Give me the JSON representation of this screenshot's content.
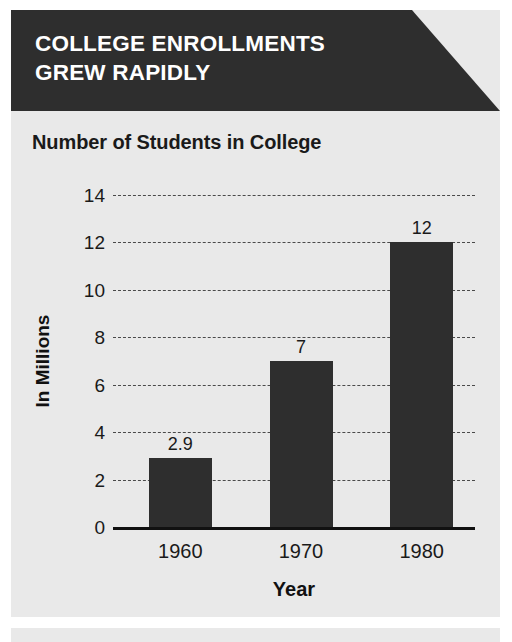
{
  "header": {
    "title": "COLLEGE ENROLLMENTS\nGREW RAPIDLY"
  },
  "colors": {
    "banner_bg": "#2e2e2e",
    "panel_bg": "#e9e9e9",
    "bar": "#2e2e2e",
    "text": "#1a1a1a",
    "header_text": "#ffffff",
    "gridline": "#4a4a4a",
    "axis": "#111111"
  },
  "chart_data": {
    "type": "bar",
    "title": "Number of Students in College",
    "xlabel": "Year",
    "ylabel": "In Millions",
    "categories": [
      "1960",
      "1970",
      "1980"
    ],
    "values": [
      2.9,
      7,
      12
    ],
    "value_labels": [
      "2.9",
      "7",
      "12"
    ],
    "ylim": [
      0,
      14
    ],
    "yticks": [
      0,
      2,
      4,
      6,
      8,
      10,
      12,
      14
    ],
    "ytick_labels": [
      "0",
      "2",
      "4",
      "6",
      "8",
      "10",
      "12",
      "14"
    ],
    "grid": true,
    "grid_style": "dotted-horizontal",
    "legend": "none"
  }
}
